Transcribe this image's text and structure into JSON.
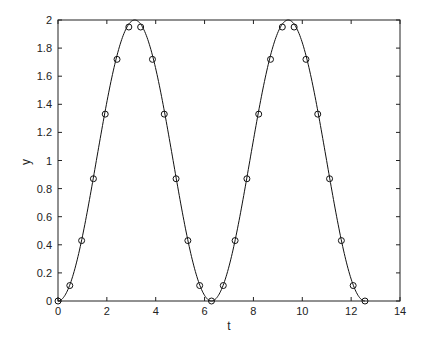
{
  "chart_data": {
    "type": "line",
    "title": "",
    "xlabel": "t",
    "ylabel": "y",
    "xlim": [
      0,
      14
    ],
    "ylim": [
      0,
      2
    ],
    "xticks": [
      0,
      2,
      4,
      6,
      8,
      10,
      12,
      14
    ],
    "yticks": [
      0,
      0.2,
      0.4,
      0.6,
      0.8,
      1,
      1.2,
      1.4,
      1.6,
      1.8,
      2
    ],
    "grid": false,
    "legend": null,
    "series": [
      {
        "name": "curve",
        "style": "solid line",
        "function": "y = 1 - cos(t)",
        "t_range": [
          0,
          12.566
        ]
      },
      {
        "name": "samples",
        "style": "circle markers",
        "x": [
          0,
          0.483,
          0.967,
          1.45,
          1.933,
          2.417,
          2.9,
          3.383,
          3.867,
          4.35,
          4.833,
          5.316,
          5.8,
          6.283,
          6.766,
          7.25,
          7.733,
          8.216,
          8.7,
          9.183,
          9.666,
          10.15,
          10.633,
          11.116,
          11.6,
          12.083,
          12.566
        ],
        "values": [
          0,
          0.11,
          0.43,
          0.87,
          1.33,
          1.72,
          1.95,
          1.95,
          1.72,
          1.33,
          0.87,
          0.43,
          0.11,
          0,
          0.11,
          0.43,
          0.87,
          1.33,
          1.72,
          1.95,
          1.95,
          1.72,
          1.33,
          0.87,
          0.43,
          0.11,
          0
        ]
      }
    ]
  }
}
